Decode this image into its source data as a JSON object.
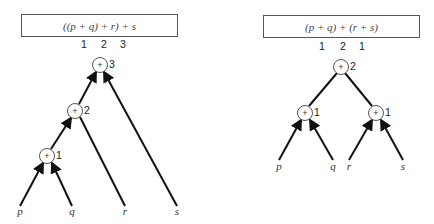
{
  "left_diagram": {
    "expression": "((p + q) + r) + s",
    "depth_numbers": [
      "1",
      "2",
      "3"
    ],
    "nodes": [
      {
        "op": "+",
        "level": "3"
      },
      {
        "op": "+",
        "level": "2"
      },
      {
        "op": "+",
        "level": "1"
      }
    ],
    "leaves": [
      "p",
      "q",
      "r",
      "s"
    ]
  },
  "right_diagram": {
    "expression": "(p + q) + (r + s)",
    "depth_numbers": [
      "1",
      "2",
      "1"
    ],
    "nodes": [
      {
        "op": "+",
        "level": "2"
      },
      {
        "op": "+",
        "level": "1"
      },
      {
        "op": "+",
        "level": "1"
      }
    ],
    "leaves": [
      "p",
      "q",
      "r",
      "s"
    ]
  },
  "colors": {
    "line": "#111111",
    "box_border": "#555555"
  }
}
